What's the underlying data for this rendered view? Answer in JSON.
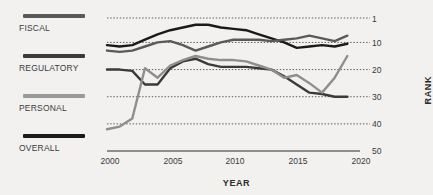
{
  "legend": {
    "entries": [
      {
        "label": "FISCAL",
        "color": "#5a5a5a",
        "swatch_name": "fiscal"
      },
      {
        "label": "REGULATORY",
        "color": "#3a3a3a",
        "swatch_name": "regulatory"
      },
      {
        "label": "PERSONAL",
        "color": "#8e8e8e",
        "swatch_name": "personal"
      },
      {
        "label": "OVERALL",
        "color": "#1a1a1a",
        "swatch_name": "overall"
      }
    ]
  },
  "axes": {
    "x_title": "YEAR",
    "y_title": "RANK",
    "x_ticks": [
      "2000",
      "2005",
      "2010",
      "2015",
      "2020"
    ],
    "y_ticks": [
      "1",
      "10",
      "20",
      "30",
      "40",
      "50"
    ]
  },
  "chart_data": {
    "type": "line",
    "title": "",
    "xlabel": "YEAR",
    "ylabel": "RANK",
    "xlim": [
      2000,
      2020
    ],
    "ylim": [
      1,
      50
    ],
    "y_inverted": true,
    "grid": "horizontal-dotted",
    "legend_position": "left",
    "x": [
      2000,
      2001,
      2002,
      2003,
      2004,
      2005,
      2006,
      2007,
      2008,
      2009,
      2010,
      2011,
      2012,
      2013,
      2014,
      2015,
      2016,
      2017,
      2018,
      2019
    ],
    "series": [
      {
        "name": "OVERALL",
        "color": "#1a1a1a",
        "values": [
          11,
          11.5,
          11,
          9,
          7,
          5.5,
          4.5,
          3.5,
          3.5,
          4.5,
          5,
          5.5,
          7,
          8.5,
          10,
          12,
          11.5,
          11,
          11.5,
          10.5
        ]
      },
      {
        "name": "FISCAL",
        "color": "#5a5a5a",
        "values": [
          13,
          13.5,
          13,
          11.5,
          10,
          9.5,
          11,
          13,
          11.5,
          10,
          9,
          9,
          9,
          9.5,
          9,
          8.5,
          7.5,
          8.5,
          9.5,
          7.5
        ]
      },
      {
        "name": "REGULATORY",
        "color": "#3a3a3a",
        "values": [
          20,
          20,
          20.5,
          25.5,
          25.5,
          19.5,
          17,
          16,
          18,
          19,
          19,
          19,
          19.5,
          20,
          22.5,
          25.5,
          28.5,
          29,
          30,
          30
        ]
      },
      {
        "name": "PERSONAL",
        "color": "#8e8e8e",
        "values": [
          42,
          41,
          38,
          19.5,
          23,
          18.5,
          16.5,
          15,
          16,
          16.5,
          16.5,
          17,
          18.5,
          20,
          23,
          22,
          25,
          28.5,
          23,
          15
        ]
      }
    ]
  }
}
